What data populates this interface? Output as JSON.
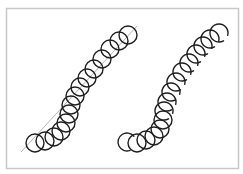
{
  "diagram": {
    "frame": {
      "x": 6,
      "y": 8,
      "width": 232,
      "height": 160,
      "stroke": "#c8c8c8",
      "fill": "#ffffff"
    },
    "colors": {
      "circle_stroke": "#1e1e1e",
      "guide_line": "#b4b4b4"
    },
    "left_chain": {
      "label": "",
      "guide_line": {
        "x1": 21,
        "y1": 152,
        "x2": 137,
        "y2": 26
      },
      "radius": 9,
      "circles": [
        [
          35,
          143
        ],
        [
          45,
          141
        ],
        [
          54,
          137
        ],
        [
          61,
          131
        ],
        [
          66,
          123
        ],
        [
          69,
          114
        ],
        [
          71,
          105
        ],
        [
          75,
          96
        ],
        [
          80,
          87
        ],
        [
          87,
          78
        ],
        [
          94,
          69
        ],
        [
          102,
          59
        ],
        [
          110,
          49
        ],
        [
          119,
          41
        ],
        [
          128,
          35
        ]
      ]
    },
    "right_chain": {
      "label": "",
      "radius": 9,
      "circles": [
        {
          "c": [
            127,
            142
          ],
          "broken": true
        },
        {
          "c": [
            137,
            143
          ],
          "broken": false
        },
        {
          "c": [
            146,
            140
          ],
          "broken": false
        },
        {
          "c": [
            154,
            136
          ],
          "broken": false
        },
        {
          "c": [
            160,
            129
          ],
          "broken": false
        },
        {
          "c": [
            163,
            120
          ],
          "broken": false
        },
        {
          "c": [
            164,
            111
          ],
          "broken": true
        },
        {
          "c": [
            167,
            102
          ],
          "broken": true
        },
        {
          "c": [
            171,
            92
          ],
          "broken": true
        },
        {
          "c": [
            176,
            82
          ],
          "broken": true
        },
        {
          "c": [
            182,
            72
          ],
          "broken": true
        },
        {
          "c": [
            189,
            63
          ],
          "broken": true
        },
        {
          "c": [
            196,
            54
          ],
          "broken": true
        },
        {
          "c": [
            203,
            46
          ],
          "broken": true
        },
        {
          "c": [
            210,
            39
          ],
          "broken": true
        },
        {
          "c": [
            219,
            33
          ],
          "broken": true
        }
      ]
    }
  }
}
